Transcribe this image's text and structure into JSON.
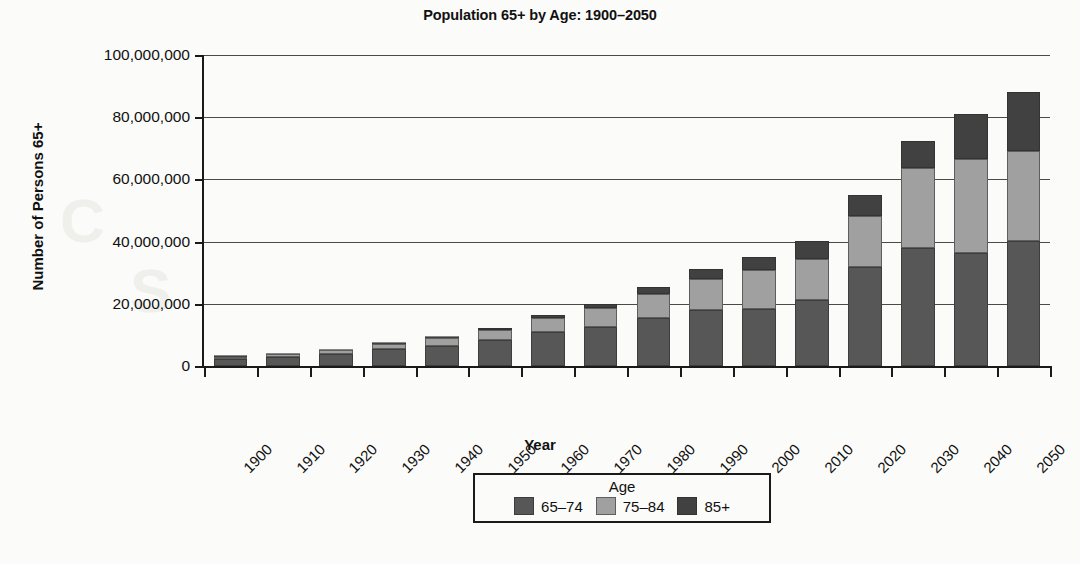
{
  "chart_data": {
    "type": "bar",
    "stacked": true,
    "title": "Population 65+ by Age: 1900–2050",
    "xlabel": "Year",
    "ylabel": "Number of Persons 65+",
    "grid": true,
    "legend_position": "bottom",
    "legend_title": "Age",
    "ylim": [
      0,
      100000000
    ],
    "yticks": [
      0,
      20000000,
      40000000,
      60000000,
      80000000,
      100000000
    ],
    "ytick_labels": [
      "0",
      "20,000,000",
      "40,000,000",
      "60,000,000",
      "80,000,000",
      "100,000,000"
    ],
    "categories": [
      "1900",
      "1910",
      "1920",
      "1930",
      "1940",
      "1950",
      "1960",
      "1970",
      "1980",
      "1990",
      "2000",
      "2010",
      "2020",
      "2030",
      "2040",
      "2050"
    ],
    "series": [
      {
        "name": "65–74",
        "color": "#575757",
        "values": [
          2190000,
          2790000,
          3760000,
          5370000,
          6370000,
          8420000,
          10960000,
          12440000,
          15580000,
          18040000,
          18390000,
          21240000,
          31860000,
          37840000,
          36350000,
          40270000
        ]
      },
      {
        "name": "75–84",
        "color": "#a0a0a0",
        "values": [
          770000,
          990000,
          1260000,
          1760000,
          2640000,
          3280000,
          4630000,
          6120000,
          7730000,
          10060000,
          12360000,
          13070000,
          16480000,
          25860000,
          30330000,
          28800000
        ]
      },
      {
        "name": "85+",
        "color": "#414141",
        "values": [
          120000,
          170000,
          210000,
          270000,
          370000,
          590000,
          940000,
          1410000,
          2240000,
          3020000,
          4240000,
          5750000,
          6600000,
          8740000,
          14200000,
          18920000
        ]
      }
    ],
    "totals": [
      3080000,
      3950000,
      5230000,
      7400000,
      9380000,
      12290000,
      16530000,
      19970000,
      25550000,
      31120000,
      34990000,
      40060000,
      54940000,
      72440000,
      80880000,
      87990000
    ]
  }
}
